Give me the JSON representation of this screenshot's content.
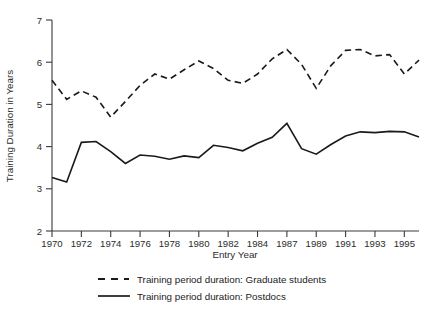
{
  "chart_data": {
    "type": "line",
    "title": "",
    "xlabel": "Entry Year",
    "ylabel": "Training Duration in Years",
    "xlim": [
      1970,
      1995
    ],
    "ylim": [
      2,
      7
    ],
    "yticks": [
      2,
      3,
      4,
      5,
      6,
      7
    ],
    "ytick_labels": [
      "2",
      "3",
      "4",
      "5",
      "6",
      "7"
    ],
    "x": [
      1970,
      1971,
      1972,
      1973,
      1974,
      1975,
      1976,
      1977,
      1978,
      1979,
      1980,
      1981,
      1982,
      1983,
      1984,
      1985,
      1986,
      1987,
      1988,
      1989,
      1990,
      1991,
      1992,
      1993,
      1994,
      1995
    ],
    "xtick_labels": [
      "1970",
      "",
      "1972",
      "",
      "1974",
      "",
      "1976",
      "",
      "1978",
      "",
      "1980",
      "",
      "1982",
      "",
      "1984",
      "",
      "1987",
      "",
      "1989",
      "",
      "1991",
      "",
      "1993",
      "",
      "1995",
      ""
    ],
    "xtick_labels_shown": [
      "1970",
      "1972",
      "1974",
      "1976",
      "1978",
      "1980",
      "1982",
      "1984",
      "1987",
      "1989",
      "1991",
      "1993",
      "1995"
    ],
    "grid": false,
    "legend_position": "bottom",
    "series": [
      {
        "name": "Training period duration: Graduate students",
        "style": "dashed",
        "color": "#1a1a1a",
        "values": [
          5.57,
          5.12,
          5.32,
          5.17,
          4.7,
          5.07,
          5.45,
          5.72,
          5.6,
          5.82,
          6.03,
          5.85,
          5.57,
          5.5,
          5.72,
          6.08,
          6.3,
          5.95,
          5.38,
          5.92,
          6.28,
          6.3,
          6.15,
          6.18,
          5.72,
          6.05
        ]
      },
      {
        "name": "Training period duration: Postdocs",
        "style": "solid",
        "color": "#1a1a1a",
        "values": [
          3.27,
          3.16,
          4.1,
          4.12,
          3.88,
          3.6,
          3.8,
          3.77,
          3.7,
          3.78,
          3.74,
          4.03,
          3.98,
          3.9,
          4.08,
          4.22,
          4.55,
          3.95,
          3.82,
          4.05,
          4.25,
          4.35,
          4.33,
          4.36,
          4.35,
          4.23
        ]
      }
    ]
  },
  "legend": {
    "items": [
      {
        "label": "Training period duration: Graduate students",
        "style": "dashed"
      },
      {
        "label": "Training period duration: Postdocs",
        "style": "solid"
      }
    ]
  }
}
